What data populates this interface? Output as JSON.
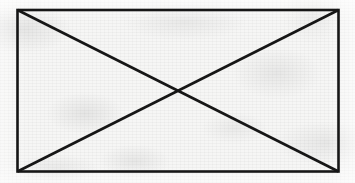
{
  "figure": {
    "kind": "crossed-box-placeholder",
    "medium": "scanned paper",
    "canvas": {
      "width": 355,
      "height": 183
    },
    "background_color": "#f6f6f5",
    "ink_color": "#161616",
    "stroke_width": 2.6,
    "rect": {
      "x": 17.5,
      "y": 10.0,
      "width": 321.0,
      "height": 161.5
    },
    "corners": {
      "top_left": {
        "x": 17.5,
        "y": 10.0
      },
      "top_right": {
        "x": 338.5,
        "y": 10.0
      },
      "bottom_right": {
        "x": 338.5,
        "y": 171.5
      },
      "bottom_left": {
        "x": 17.5,
        "y": 171.5
      }
    },
    "diagonals": [
      {
        "name": "diagonal-tl-br",
        "x1": 17.5,
        "y1": 10.0,
        "x2": 338.5,
        "y2": 171.5
      },
      {
        "name": "diagonal-bl-tr",
        "x1": 17.5,
        "y1": 171.5,
        "x2": 338.5,
        "y2": 10.0
      }
    ],
    "intersection": {
      "x": 178.0,
      "y": 90.75
    },
    "edges": [
      {
        "name": "edge-top",
        "x1": 17.5,
        "y1": 10.0,
        "x2": 338.5,
        "y2": 10.0
      },
      {
        "name": "edge-right",
        "x1": 338.5,
        "y1": 10.0,
        "x2": 338.5,
        "y2": 171.5
      },
      {
        "name": "edge-bottom",
        "x1": 338.5,
        "y1": 171.5,
        "x2": 17.5,
        "y2": 171.5
      },
      {
        "name": "edge-left",
        "x1": 17.5,
        "y1": 171.5,
        "x2": 17.5,
        "y2": 10.0
      }
    ],
    "labels": [],
    "text": []
  }
}
